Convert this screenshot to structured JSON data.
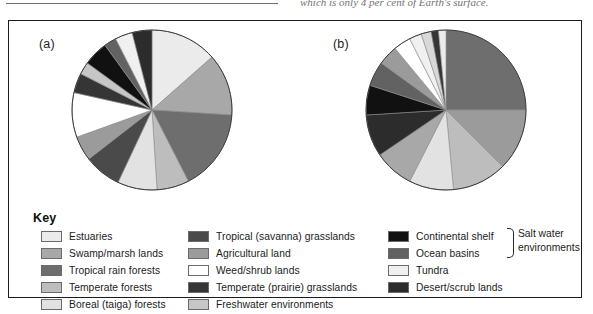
{
  "page": {
    "caption_fragment": "which is only 4 per cent of Earth's surface."
  },
  "figure": {
    "panels": [
      {
        "id": "a",
        "label": "(a)"
      },
      {
        "id": "b",
        "label": "(b)"
      }
    ]
  },
  "key": {
    "title": "Key",
    "columns": [
      {
        "items": [
          {
            "label": "Estuaries",
            "color": "#ebebeb"
          },
          {
            "label": "Swamp/marsh lands",
            "color": "#a8a8a8"
          },
          {
            "label": "Tropical rain forests",
            "color": "#6e6e6e"
          },
          {
            "label": "Temperate forests",
            "color": "#bdbdbd"
          },
          {
            "label": "Boreal (taiga) forests",
            "color": "#e2e2e2"
          }
        ]
      },
      {
        "items": [
          {
            "label": "Tropical (savanna) grasslands",
            "color": "#4a4a4a"
          },
          {
            "label": "Agricultural land",
            "color": "#9b9b9b"
          },
          {
            "label": "Weed/shrub lands",
            "color": "#ffffff"
          },
          {
            "label": "Temperate (prairie) grasslands",
            "color": "#353535"
          },
          {
            "label": "Freshwater environments",
            "color": "#c6c6c6"
          }
        ]
      },
      {
        "items": [
          {
            "label": "Continental shelf",
            "color": "#111111"
          },
          {
            "label": "Ocean basins",
            "color": "#626262"
          },
          {
            "label": "Tundra",
            "color": "#f0f0f0"
          },
          {
            "label": "Desert/scrub lands",
            "color": "#2c2c2c"
          }
        ]
      }
    ],
    "annotation": {
      "line1": "Salt water",
      "line2": "environments",
      "brace": "brace-bracket"
    }
  },
  "chart_data": [
    {
      "type": "pie",
      "title": "(a)",
      "id": "pie-a",
      "start_angle": 0,
      "direction": "clockwise",
      "labels": [
        "Estuaries",
        "Swamp/marsh lands",
        "Tropical rain forests",
        "Temperate forests",
        "Boreal (taiga) forests",
        "Tropical (savanna) grasslands",
        "Agricultural land",
        "Weed/shrub lands",
        "Temperate (prairie) grasslands",
        "Freshwater environments",
        "Continental shelf",
        "Ocean basins",
        "Tundra",
        "Desert/scrub lands"
      ],
      "values": [
        13.5,
        12.5,
        16.5,
        6.5,
        8.0,
        7.5,
        5.0,
        9.0,
        4.0,
        2.5,
        5.0,
        2.5,
        3.5,
        4.0
      ],
      "colors": [
        "#ebebeb",
        "#a8a8a8",
        "#6e6e6e",
        "#bdbdbd",
        "#e2e2e2",
        "#4a4a4a",
        "#9b9b9b",
        "#ffffff",
        "#353535",
        "#c6c6c6",
        "#111111",
        "#626262",
        "#f0f0f0",
        "#2c2c2c"
      ],
      "units": "per cent of net primary productivity",
      "legend_position": "below"
    },
    {
      "type": "pie",
      "title": "(b)",
      "id": "pie-b",
      "start_angle": 0,
      "direction": "clockwise",
      "labels": [
        "Ocean basins",
        "Agricultural land",
        "Tropical rain forests",
        "Boreal (taiga) forests",
        "Swamp/marsh lands",
        "Temperate (prairie) grasslands",
        "Continental shelf",
        "Desert/scrub lands",
        "Temperate forests",
        "Weed/shrub lands",
        "Tundra",
        "Freshwater environments",
        "Tropical (savanna) grasslands",
        "Estuaries"
      ],
      "values": [
        25.0,
        12.5,
        11.0,
        9.0,
        8.0,
        8.5,
        6.0,
        5.0,
        4.0,
        3.5,
        2.5,
        2.0,
        1.5,
        1.5
      ],
      "colors": [
        "#6e6e6e",
        "#9b9b9b",
        "#bdbdbd",
        "#e2e2e2",
        "#a8a8a8",
        "#2c2c2c",
        "#111111",
        "#626262",
        "#9b9b9b",
        "#ffffff",
        "#f0f0f0",
        "#d8d8d8",
        "#353535",
        "#ebebeb"
      ],
      "units": "per cent of world total",
      "legend_position": "below"
    }
  ]
}
